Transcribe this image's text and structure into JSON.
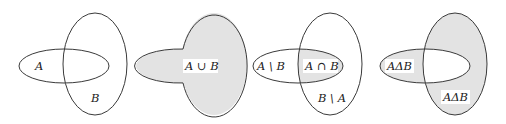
{
  "diagram": {
    "colors": {
      "stroke": "#3a3a3a",
      "shade": "#e3e3e3",
      "label_bg": "#ffffff",
      "text": "#222222"
    },
    "panels": [
      {
        "id": "sets",
        "operation": "none",
        "labels": {
          "a": "A",
          "b": "B"
        }
      },
      {
        "id": "union",
        "operation": "union",
        "labels": {
          "union": "A ∪ B"
        }
      },
      {
        "id": "difference-intersection",
        "operation": "intersection",
        "labels": {
          "a_minus_b": "A \\ B",
          "a_and_b": "A ∩ B",
          "b_minus_a": "B \\ A"
        }
      },
      {
        "id": "symmetric-difference",
        "operation": "symmetric-difference",
        "labels": {
          "left": "AΔB",
          "right": "AΔB"
        }
      }
    ]
  }
}
